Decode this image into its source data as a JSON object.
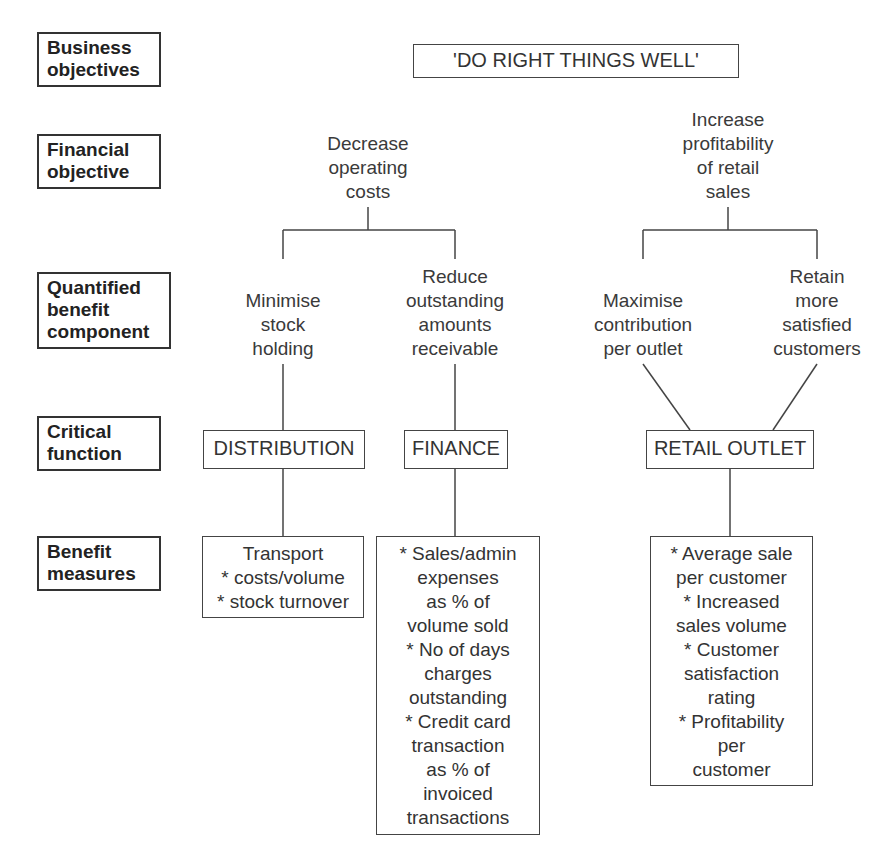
{
  "row_labels": {
    "business_objectives": "Business\nobjectives",
    "financial_objective": "Financial\nobjective",
    "quantified_benefit_component": "Quantified\nbenefit\ncomponent",
    "critical_function": "Critical\nfunction",
    "benefit_measures": "Benefit\nmeasures"
  },
  "business_objective": "'DO RIGHT THINGS WELL'",
  "financial_objectives": {
    "left": "Decrease\noperating\ncosts",
    "right": "Increase\nprofitability\nof retail\nsales"
  },
  "benefit_components": {
    "minimise_stock": "Minimise\nstock\nholding",
    "reduce_receivables": "Reduce\noutstanding\namounts\nreceivable",
    "maximise_contribution": "Maximise\ncontribution\nper outlet",
    "retain_customers": "Retain\nmore\nsatisfied\ncustomers"
  },
  "critical_functions": {
    "distribution": "DISTRIBUTION",
    "finance": "FINANCE",
    "retail_outlet": "RETAIL OUTLET"
  },
  "benefit_measures": {
    "distribution": "Transport\n* costs/volume\n* stock turnover",
    "finance": "* Sales/admin\nexpenses\nas % of\nvolume sold\n* No of days\ncharges\noutstanding\n* Credit card\ntransaction\nas % of\ninvoiced\ntransactions",
    "retail_outlet": "* Average sale\nper customer\n* Increased\nsales volume\n* Customer\nsatisfaction\nrating\n* Profitability\nper\ncustomer"
  }
}
